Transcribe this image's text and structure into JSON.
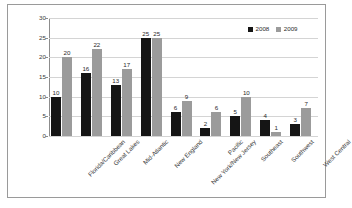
{
  "chart_data": {
    "type": "bar",
    "title": "",
    "subtitle": "",
    "xlabel": "",
    "ylabel": "",
    "ylim": [
      0,
      30
    ],
    "yticks": [
      0,
      5,
      10,
      15,
      20,
      25,
      30
    ],
    "grid": true,
    "legend_position": "top-right",
    "categories": [
      "Florida/Caribbean",
      "Great Lakes",
      "Mid-Atlantic",
      "New England",
      "New York/New Jersey",
      "Pacific",
      "Southeast",
      "Southwest",
      "West Central"
    ],
    "series": [
      {
        "name": "2008",
        "color": "#151515",
        "values": [
          10,
          16,
          13,
          25,
          6,
          2,
          5,
          4,
          3
        ]
      },
      {
        "name": "2009",
        "color": "#9b9b9b",
        "values": [
          20,
          22,
          17,
          25,
          9,
          6,
          10,
          1,
          7
        ]
      }
    ]
  },
  "legend": {
    "items": [
      {
        "label": "2008",
        "color": "#151515"
      },
      {
        "label": "2009",
        "color": "#9b9b9b"
      }
    ]
  },
  "caption": {
    "text": ""
  }
}
